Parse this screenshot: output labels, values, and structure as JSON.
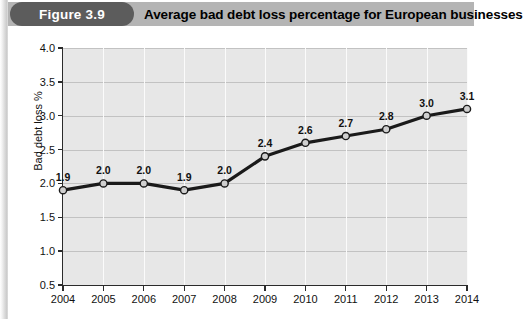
{
  "header": {
    "badge_label": "Figure 3.9",
    "title": "Average bad debt loss percentage for European businesses",
    "badge_color": "#5c5c5c",
    "title_bar_color": "#b4b4b4"
  },
  "caption": {
    "text": ""
  },
  "chart_data": {
    "type": "line",
    "title": "Average bad debt loss percentage for European businesses",
    "xlabel": "",
    "ylabel": "Bad debt loss %",
    "categories": [
      "2004",
      "2005",
      "2006",
      "2007",
      "2008",
      "2009",
      "2010",
      "2011",
      "2012",
      "2013",
      "2014"
    ],
    "values": [
      1.9,
      2.0,
      2.0,
      1.9,
      2.0,
      2.4,
      2.6,
      2.7,
      2.8,
      3.0,
      3.1
    ],
    "point_labels": [
      "1.9",
      "2.0",
      "2.0",
      "1.9",
      "2.0",
      "2.4",
      "2.6",
      "2.7",
      "2.8",
      "3.0",
      "3.1"
    ],
    "ylim": [
      0.5,
      4.0
    ],
    "ytick_values": [
      0.5,
      1.0,
      1.5,
      2.0,
      2.5,
      3.0,
      3.5,
      4.0
    ],
    "ytick_labels": [
      "0.5",
      "1.0",
      "1.5",
      "2.0",
      "2.5",
      "3.0",
      "3.5",
      "4.0"
    ],
    "grid": true,
    "legend": false,
    "plot_background": "#e7e7e7",
    "line_color": "#1a1a1a",
    "marker_fill": "#cfcfcf",
    "marker_edge": "#1a1a1a"
  }
}
